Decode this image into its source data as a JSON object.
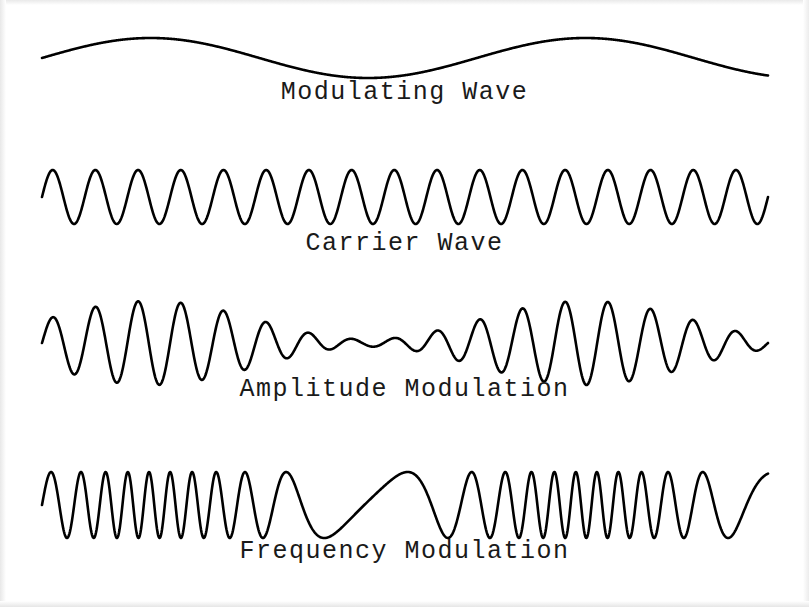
{
  "figure": {
    "background_color": "#ffffff",
    "stroke_color": "#000000",
    "width": 809,
    "height": 607
  },
  "chart_data": {
    "type": "line",
    "title": "",
    "xlabel": "",
    "ylabel": "",
    "grid": false,
    "legend": "none",
    "x_start": 42,
    "x_end": 768,
    "series": [
      {
        "name": "Modulating Wave",
        "label": "Modulating Wave",
        "kind": "modulating",
        "baseline_y": 58,
        "amplitude": 20,
        "cycles": 1.67,
        "phase": 0,
        "stroke_width": 2.6,
        "label_y": 92,
        "peaks_x": [
          180,
          615
        ],
        "troughs_x": [
          390
        ],
        "y_top": 38,
        "y_bottom": 78
      },
      {
        "name": "Carrier Wave",
        "label": "Carrier Wave",
        "kind": "carrier",
        "baseline_y": 197,
        "amplitude": 27,
        "cycles": 17,
        "phase": 0,
        "stroke_width": 2.6,
        "label_y": 243,
        "y_top": 170,
        "y_bottom": 225
      },
      {
        "name": "Amplitude Modulation",
        "label": "Amplitude Modulation",
        "kind": "am",
        "baseline_y": 343,
        "amplitude": 42,
        "cycles": 17,
        "phase": 0,
        "modulation_index": 0.84,
        "envelope_cycles": 1.67,
        "stroke_width": 2.6,
        "label_y": 389,
        "y_top": 300,
        "y_bottom": 385
      },
      {
        "name": "Frequency Modulation",
        "label": "Frequency Modulation",
        "kind": "fm",
        "baseline_y": 505,
        "amplitude": 33,
        "cycles": 19,
        "phase": 0,
        "deviation": 0.82,
        "modulator_cycles": 1.67,
        "stroke_width": 2.6,
        "label_y": 551,
        "y_top": 472,
        "y_bottom": 538
      }
    ]
  },
  "captions": {
    "modulating": "Modulating Wave",
    "carrier": "Carrier Wave",
    "amplitude_modulation": "Amplitude Modulation",
    "frequency_modulation": "Frequency Modulation"
  }
}
